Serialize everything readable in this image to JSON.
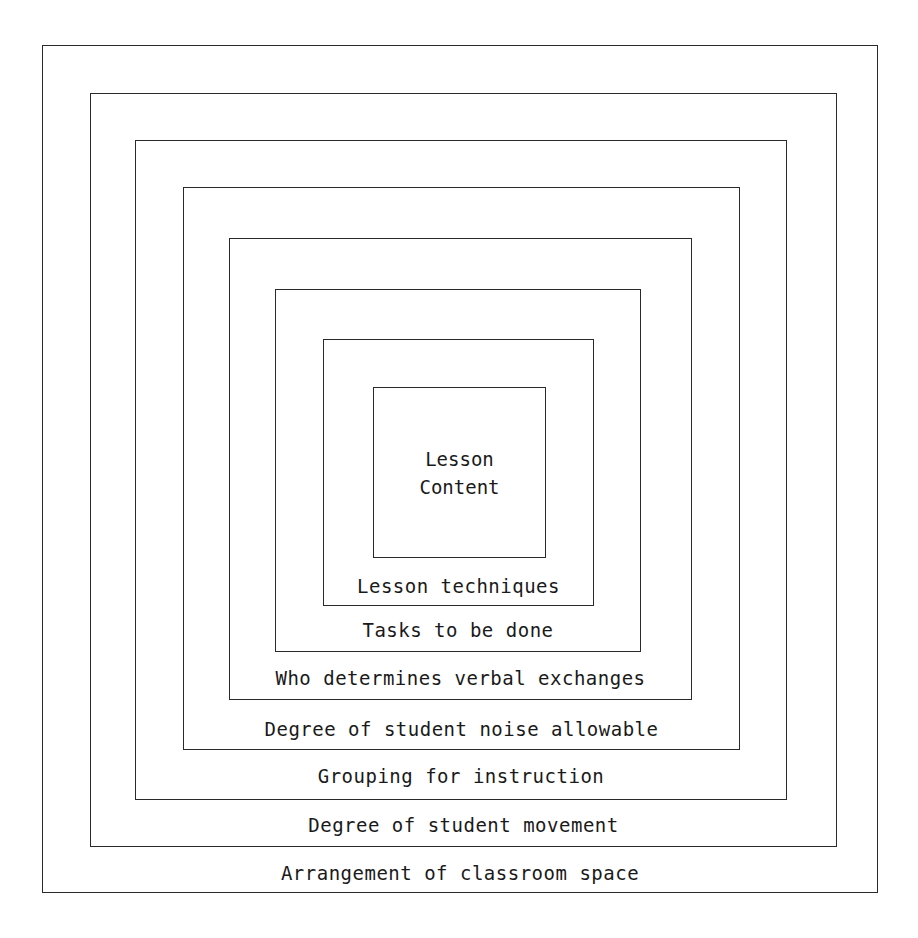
{
  "diagram": {
    "type": "nested-squares",
    "layers": [
      {
        "label": "Arrangement of classroom space",
        "box": [
          42,
          45,
          878,
          893
        ]
      },
      {
        "label": "Degree of student movement",
        "box": [
          90,
          93,
          837,
          847
        ]
      },
      {
        "label": "Grouping for instruction",
        "box": [
          135,
          140,
          787,
          800
        ]
      },
      {
        "label": "Degree of student noise allowable",
        "box": [
          183,
          187,
          740,
          750
        ]
      },
      {
        "label": "Who determines verbal exchanges",
        "box": [
          229,
          238,
          692,
          700
        ]
      },
      {
        "label": "Tasks to be done",
        "box": [
          275,
          289,
          641,
          652
        ]
      },
      {
        "label": "Lesson techniques",
        "box": [
          323,
          339,
          594,
          606
        ]
      }
    ],
    "core": {
      "line1": "Lesson",
      "line2": "Content",
      "box": [
        373,
        387,
        546,
        558
      ]
    }
  }
}
